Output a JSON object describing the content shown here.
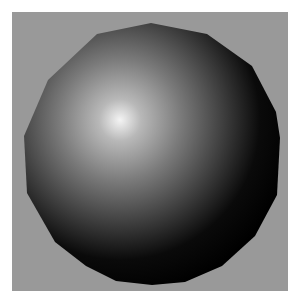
{
  "scene": {
    "description": "Shaded low-polygon sphere on gray background",
    "background_color": "#999999",
    "border_color": "#ffffff",
    "sphere": {
      "highlight_color": "#f2f2f2",
      "mid_color": "#6e6e6e",
      "shadow_color": "#000000"
    }
  }
}
